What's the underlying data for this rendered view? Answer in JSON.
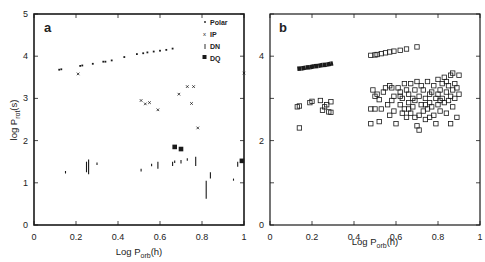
{
  "chart_data": [
    {
      "panel": "a",
      "type": "scatter",
      "title": "",
      "panel_label": "a",
      "xlabel": "Log P_orb(h)",
      "ylabel": "log P_rot(s)",
      "xlim": [
        0,
        1
      ],
      "ylim": [
        0,
        5
      ],
      "xticks": [
        "0",
        "0.2",
        "0.4",
        "0.6",
        "0.8",
        "1"
      ],
      "yticks": [
        "0",
        "1",
        "2",
        "3",
        "4",
        "5"
      ],
      "grid": false,
      "legend_position": "upper right",
      "legend": [
        "Polar",
        "IP",
        "DN",
        "DQ"
      ],
      "series": [
        {
          "name": "Polar",
          "marker": "dot",
          "points": [
            [
              0.12,
              3.68
            ],
            [
              0.13,
              3.69
            ],
            [
              0.22,
              3.77
            ],
            [
              0.23,
              3.78
            ],
            [
              0.28,
              3.82
            ],
            [
              0.33,
              3.87
            ],
            [
              0.34,
              3.87
            ],
            [
              0.37,
              3.9
            ],
            [
              0.43,
              3.98
            ],
            [
              0.49,
              4.05
            ],
            [
              0.52,
              4.07
            ],
            [
              0.54,
              4.09
            ],
            [
              0.57,
              4.11
            ],
            [
              0.6,
              4.13
            ],
            [
              0.63,
              4.15
            ],
            [
              0.66,
              4.18
            ]
          ]
        },
        {
          "name": "IP",
          "marker": "x",
          "points": [
            [
              0.21,
              3.58
            ],
            [
              0.51,
              2.95
            ],
            [
              0.53,
              2.87
            ],
            [
              0.55,
              2.9
            ],
            [
              0.59,
              2.73
            ],
            [
              0.69,
              3.1
            ],
            [
              0.73,
              3.28
            ],
            [
              0.76,
              3.28
            ],
            [
              0.75,
              2.88
            ],
            [
              0.78,
              2.3
            ],
            [
              1.0,
              3.6
            ]
          ]
        },
        {
          "name": "DN",
          "marker": "vbar",
          "ranges": [
            [
              0.15,
              1.22,
              1.28
            ],
            [
              0.25,
              1.25,
              1.5
            ],
            [
              0.26,
              1.2,
              1.55
            ],
            [
              0.3,
              1.42,
              1.48
            ],
            [
              0.51,
              1.27,
              1.33
            ],
            [
              0.56,
              1.39,
              1.45
            ],
            [
              0.59,
              1.33,
              1.5
            ],
            [
              0.66,
              1.4,
              1.5
            ],
            [
              0.67,
              1.47,
              1.53
            ],
            [
              0.7,
              1.46,
              1.54
            ],
            [
              0.73,
              1.52,
              1.58
            ],
            [
              0.77,
              1.4,
              1.62
            ],
            [
              0.82,
              0.62,
              1.05
            ],
            [
              0.84,
              1.1,
              1.25
            ],
            [
              0.95,
              1.05,
              1.1
            ],
            [
              0.97,
              1.38,
              1.5
            ]
          ]
        },
        {
          "name": "DQ",
          "marker": "filled-square",
          "points": [
            [
              0.67,
              1.85
            ],
            [
              0.7,
              1.8
            ],
            [
              0.99,
              1.52
            ]
          ]
        }
      ]
    },
    {
      "panel": "b",
      "type": "scatter",
      "title": "",
      "panel_label": "b",
      "xlabel": "Log P_orb(h)",
      "ylabel": "",
      "xlim": [
        0,
        1
      ],
      "ylim": [
        0,
        5
      ],
      "xticks": [
        "0",
        "0.2",
        "0.4",
        "0.6",
        "0.8",
        "1"
      ],
      "yticks": [
        "0",
        "2",
        "4"
      ],
      "grid": false,
      "series": [
        {
          "name": "Upper sequence (dense)",
          "marker": "filled-band",
          "points": [
            [
              0.13,
              3.7
            ],
            [
              0.15,
              3.71
            ],
            [
              0.17,
              3.73
            ],
            [
              0.19,
              3.74
            ],
            [
              0.21,
              3.76
            ],
            [
              0.23,
              3.77
            ],
            [
              0.25,
              3.79
            ],
            [
              0.27,
              3.8
            ],
            [
              0.29,
              3.82
            ],
            [
              0.3,
              3.83
            ]
          ]
        },
        {
          "name": "Upper sequence (open)",
          "marker": "open-square",
          "points": [
            [
              0.48,
              4.02
            ],
            [
              0.5,
              4.03
            ],
            [
              0.51,
              4.04
            ],
            [
              0.53,
              4.06
            ],
            [
              0.55,
              4.08
            ],
            [
              0.57,
              4.1
            ],
            [
              0.59,
              4.12
            ],
            [
              0.62,
              4.14
            ],
            [
              0.65,
              4.17
            ],
            [
              0.7,
              4.22
            ]
          ]
        },
        {
          "name": "Lower cloud",
          "marker": "open-square",
          "points": [
            [
              0.13,
              2.8
            ],
            [
              0.14,
              2.82
            ],
            [
              0.14,
              2.3
            ],
            [
              0.19,
              2.9
            ],
            [
              0.2,
              2.93
            ],
            [
              0.24,
              2.95
            ],
            [
              0.25,
              2.72
            ],
            [
              0.26,
              2.8
            ],
            [
              0.27,
              2.85
            ],
            [
              0.28,
              2.68
            ],
            [
              0.29,
              2.92
            ],
            [
              0.29,
              2.67
            ],
            [
              0.48,
              2.75
            ],
            [
              0.48,
              2.4
            ],
            [
              0.49,
              3.2
            ],
            [
              0.5,
              3.05
            ],
            [
              0.5,
              2.75
            ],
            [
              0.51,
              3.1
            ],
            [
              0.52,
              2.97
            ],
            [
              0.52,
              2.45
            ],
            [
              0.53,
              2.75
            ],
            [
              0.54,
              3.15
            ],
            [
              0.55,
              3.25
            ],
            [
              0.56,
              2.85
            ],
            [
              0.57,
              3.3
            ],
            [
              0.57,
              2.6
            ],
            [
              0.58,
              2.95
            ],
            [
              0.59,
              3.05
            ],
            [
              0.59,
              2.7
            ],
            [
              0.6,
              2.4
            ],
            [
              0.61,
              3.25
            ],
            [
              0.62,
              3.15
            ],
            [
              0.62,
              2.85
            ],
            [
              0.63,
              3.0
            ],
            [
              0.64,
              2.75
            ],
            [
              0.64,
              3.35
            ],
            [
              0.65,
              3.2
            ],
            [
              0.65,
              2.55
            ],
            [
              0.66,
              2.9
            ],
            [
              0.66,
              3.1
            ],
            [
              0.67,
              3.35
            ],
            [
              0.67,
              2.65
            ],
            [
              0.68,
              3.0
            ],
            [
              0.68,
              2.8
            ],
            [
              0.69,
              3.2
            ],
            [
              0.69,
              2.55
            ],
            [
              0.7,
              3.4
            ],
            [
              0.7,
              2.35
            ],
            [
              0.71,
              3.05
            ],
            [
              0.71,
              2.6
            ],
            [
              0.71,
              2.25
            ],
            [
              0.72,
              2.85
            ],
            [
              0.73,
              3.2
            ],
            [
              0.73,
              2.7
            ],
            [
              0.74,
              3.0
            ],
            [
              0.74,
              2.5
            ],
            [
              0.75,
              3.4
            ],
            [
              0.75,
              2.75
            ],
            [
              0.76,
              2.9
            ],
            [
              0.76,
              2.55
            ],
            [
              0.77,
              3.15
            ],
            [
              0.77,
              2.8
            ],
            [
              0.78,
              3.3
            ],
            [
              0.78,
              2.6
            ],
            [
              0.79,
              3.0
            ],
            [
              0.79,
              2.4
            ],
            [
              0.8,
              3.45
            ],
            [
              0.8,
              2.85
            ],
            [
              0.81,
              3.2
            ],
            [
              0.81,
              2.7
            ],
            [
              0.82,
              3.35
            ],
            [
              0.82,
              3.0
            ],
            [
              0.83,
              2.9
            ],
            [
              0.83,
              3.5
            ],
            [
              0.84,
              3.15
            ],
            [
              0.84,
              2.65
            ],
            [
              0.85,
              3.3
            ],
            [
              0.85,
              2.95
            ],
            [
              0.86,
              3.55
            ],
            [
              0.86,
              2.4
            ],
            [
              0.87,
              3.2
            ],
            [
              0.87,
              3.6
            ],
            [
              0.88,
              3.0
            ],
            [
              0.88,
              3.35
            ],
            [
              0.89,
              2.55
            ],
            [
              0.89,
              3.25
            ],
            [
              0.9,
              3.1
            ],
            [
              0.9,
              3.55
            ],
            [
              0.62,
              3.05
            ],
            [
              0.66,
              2.75
            ],
            [
              0.69,
              2.95
            ],
            [
              0.72,
              3.3
            ],
            [
              0.76,
              3.1
            ],
            [
              0.8,
              3.1
            ],
            [
              0.84,
              3.4
            ],
            [
              0.87,
              2.8
            ],
            [
              0.58,
              3.25
            ],
            [
              0.63,
              2.65
            ],
            [
              0.74,
              2.85
            ],
            [
              0.81,
              2.95
            ],
            [
              0.86,
              3.05
            ]
          ]
        }
      ]
    }
  ],
  "axis_labels": {
    "a_xlabel_main": "Log P",
    "a_xlabel_sub": "orb",
    "a_xlabel_unit": "(h)",
    "a_ylabel_main": "log P",
    "a_ylabel_sub": "rot",
    "a_ylabel_unit": "(s)",
    "b_xlabel_main": "Log P",
    "b_xlabel_sub": "orb",
    "b_xlabel_unit": "(h)"
  },
  "panel_labels": {
    "a": "a",
    "b": "b"
  },
  "legend": {
    "polar": "Polar",
    "ip": "IP",
    "dn": "DN",
    "dq": "DQ"
  },
  "colors": {
    "ink": "#1a1a1a",
    "background": "#ffffff"
  }
}
